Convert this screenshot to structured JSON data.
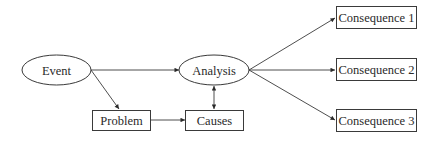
{
  "diagram": {
    "type": "flowchart",
    "nodes": {
      "event": {
        "label": "Event",
        "shape": "ellipse"
      },
      "analysis": {
        "label": "Analysis",
        "shape": "ellipse"
      },
      "problem": {
        "label": "Problem",
        "shape": "rectangle"
      },
      "causes": {
        "label": "Causes",
        "shape": "rectangle"
      },
      "consequence1": {
        "label": "Consequence 1",
        "shape": "rectangle"
      },
      "consequence2": {
        "label": "Consequence 2",
        "shape": "rectangle"
      },
      "consequence3": {
        "label": "Consequence 3",
        "shape": "rectangle"
      }
    },
    "edges": [
      {
        "from": "Event",
        "to": "Analysis",
        "direction": "forward"
      },
      {
        "from": "Event",
        "to": "Problem",
        "direction": "forward"
      },
      {
        "from": "Problem",
        "to": "Causes",
        "direction": "forward"
      },
      {
        "from": "Causes",
        "to": "Analysis",
        "direction": "bidirectional"
      },
      {
        "from": "Analysis",
        "to": "Consequence 1",
        "direction": "forward"
      },
      {
        "from": "Analysis",
        "to": "Consequence 2",
        "direction": "forward"
      },
      {
        "from": "Analysis",
        "to": "Consequence 3",
        "direction": "forward"
      }
    ],
    "colors": {
      "stroke": "#3a3a3a",
      "text": "#2a2a2a",
      "background": "#ffffff"
    }
  }
}
